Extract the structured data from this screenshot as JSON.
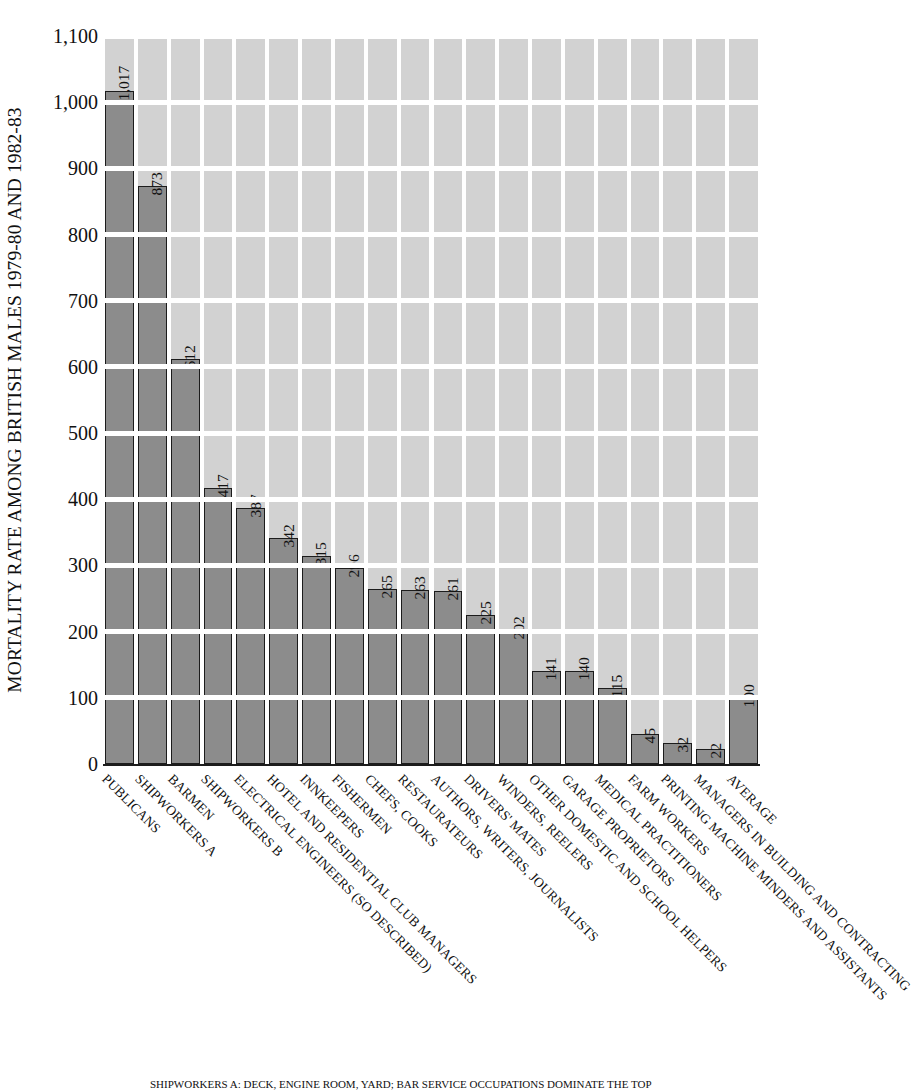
{
  "chart_data": {
    "type": "bar",
    "title": "",
    "ylabel": "MORTALITY RATE AMONG BRITISH MALES 1979-80 AND 1982-83",
    "xlabel": "",
    "ylim": [
      0,
      1100
    ],
    "ytick_values": [
      0,
      100,
      200,
      300,
      400,
      500,
      600,
      700,
      800,
      900,
      1000,
      1100
    ],
    "ytick_labels": [
      "0",
      "100",
      "200",
      "300",
      "400",
      "500",
      "600",
      "700",
      "800",
      "900",
      "1,000",
      "1,100"
    ],
    "grid": true,
    "legend": "none",
    "categories": [
      "PUBLICANS",
      "SHIPWORKERS A",
      "BARMEN",
      "SHIPWORKERS B",
      "ELECTRICAL ENGINEERS (SO DESCRIBED)",
      "HOTEL AND RESIDENTIAL CLUB MANAGERS",
      "INNKEEPERS",
      "FISHERMEN",
      "CHEFS, COOKS",
      "RESTAURATEURS",
      "AUTHORS, WRITERS, JOURNALISTS",
      "DRIVERS' MATES",
      "WINDERS, REELERS",
      "OTHER DOMESTIC AND SCHOOL HELPERS",
      "GARAGE PROPRIETORS",
      "MEDICAL PRACTITIONERS",
      "FARM WORKERS",
      "PRINTING MACHINE MINDERS AND ASSISTANTS",
      "MANAGERS IN BUILDING AND CONTRACTING",
      "AVERAGE"
    ],
    "values": [
      1017,
      873,
      612,
      417,
      387,
      342,
      315,
      296,
      265,
      263,
      261,
      225,
      202,
      141,
      140,
      115,
      45,
      32,
      22,
      100
    ],
    "value_labels": [
      "1,017",
      "873",
      "612",
      "417",
      "387",
      "342",
      "315",
      "296",
      "265",
      "263",
      "261",
      "225",
      "202",
      "141",
      "140",
      "115",
      "45",
      "32",
      "22",
      "100"
    ]
  },
  "colors": {
    "bar_fill": "#8c8c8c",
    "bar_stroke": "#1c1c1c",
    "grid_cell": "#d2d2d2",
    "background": "#ffffff",
    "text": "#111111"
  },
  "caption": {
    "text": "SHIPWORKERS A: DECK, ENGINE ROOM, YARD; BAR SERVICE OCCUPATIONS DOMINATE THE TOP"
  }
}
